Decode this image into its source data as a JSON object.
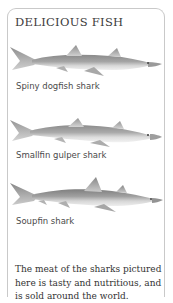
{
  "card": {
    "title": "DELICIOUS FISH",
    "border_color": "#c9c9c9",
    "background": "#ffffff"
  },
  "sharks": [
    {
      "label": "Spiny dogfish shark",
      "icon": "shark-illustration",
      "body_color": "#8d8d8d",
      "belly_color": "#e3e3e3"
    },
    {
      "label": "Smallfin gulper shark",
      "icon": "shark-illustration",
      "body_color": "#909090",
      "belly_color": "#e6e6e6"
    },
    {
      "label": "Soupfin shark",
      "icon": "shark-illustration",
      "body_color": "#8a8a8a",
      "belly_color": "#e2e2e2"
    }
  ],
  "caption": {
    "text": "The meat of the sharks pictured here is tasty and nutritious, and is sold around the world."
  }
}
